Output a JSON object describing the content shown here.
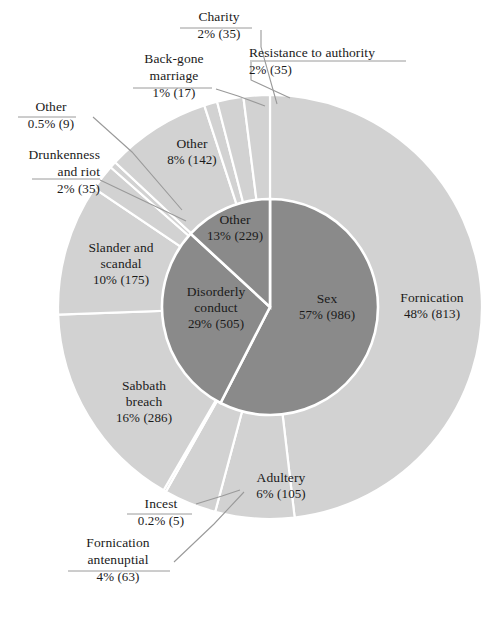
{
  "chart_data": {
    "type": "pie",
    "title": "",
    "subtitle": "",
    "xlabel": "",
    "ylabel": "",
    "legend_position": "none",
    "grid": false,
    "colors": {
      "inner_ring": "#8a8a8a",
      "outer_ring": "#d2d2d2",
      "separator": "#ffffff",
      "leader_line": "#9a9a9a",
      "text": "#1a1a1a",
      "background": "#ffffff"
    },
    "rings": [
      {
        "name": "inner",
        "slices": [
          {
            "label": "Sex",
            "percent": 57,
            "count": 986
          },
          {
            "label": "Disorderly conduct",
            "percent": 29,
            "count": 505
          },
          {
            "label": "Other",
            "percent": 13,
            "count": 229
          }
        ]
      },
      {
        "name": "outer",
        "slices": [
          {
            "label": "Fornication",
            "percent": 48,
            "count": 813,
            "parent": "Sex"
          },
          {
            "label": "Adultery",
            "percent": 6,
            "count": 105,
            "parent": "Sex"
          },
          {
            "label": "Fornication antenuptial",
            "percent": 4,
            "count": 63,
            "parent": "Sex"
          },
          {
            "label": "Incest",
            "percent": 0.2,
            "count": 5,
            "parent": "Sex"
          },
          {
            "label": "Sabbath breach",
            "percent": 16,
            "count": 286,
            "parent": "Disorderly conduct"
          },
          {
            "label": "Slander and scandal",
            "percent": 10,
            "count": 175,
            "parent": "Disorderly conduct"
          },
          {
            "label": "Drunkenness and riot",
            "percent": 2,
            "count": 35,
            "parent": "Disorderly conduct"
          },
          {
            "label": "Other",
            "percent": 0.5,
            "count": 9,
            "parent": "Disorderly conduct"
          },
          {
            "label": "Other",
            "percent": 8,
            "count": 142,
            "parent": "Other"
          },
          {
            "label": "Back-gone marriage",
            "percent": 1,
            "count": 17,
            "parent": "Other"
          },
          {
            "label": "Charity",
            "percent": 2,
            "count": 35,
            "parent": "Other"
          },
          {
            "label": "Resistance to authority",
            "percent": 2,
            "count": 35,
            "parent": "Other"
          }
        ]
      }
    ]
  },
  "labels": {
    "charity": {
      "name": "Charity",
      "value": "2% (35)"
    },
    "backgone": {
      "name": "Back-gone\nmarriage",
      "name_line1": "Back-gone",
      "name_line2": "marriage",
      "value": "1% (17)"
    },
    "resistance": {
      "name": "Resistance to authority",
      "value": "2% (35)"
    },
    "other_half": {
      "name": "Other",
      "value": "0.5% (9)"
    },
    "drunkenness": {
      "name_line1": "Drunkenness",
      "name_line2": "and riot",
      "value": "2% (35)"
    },
    "other_outer": {
      "name": "Other",
      "value": "8% (142)"
    },
    "slander": {
      "name_line1": "Slander and",
      "name_line2": "scandal",
      "value": "10% (175)"
    },
    "sabbath": {
      "name_line1": "Sabbath",
      "name_line2": "breach",
      "value": "16% (286)"
    },
    "incest": {
      "name": "Incest",
      "value": "0.2% (5)"
    },
    "fornication_antenuptial": {
      "name_line1": "Fornication",
      "name_line2": "antenuptial",
      "value": "4% (63)"
    },
    "adultery": {
      "name": "Adultery",
      "value": "6% (105)"
    },
    "fornication": {
      "name": "Fornication",
      "value": "48% (813)"
    },
    "sex": {
      "name": "Sex",
      "value": "57% (986)"
    },
    "disorderly": {
      "name_line1": "Disorderly",
      "name_line2": "conduct",
      "value": "29% (505)"
    },
    "other_inner": {
      "name": "Other",
      "value": "13% (229)"
    }
  }
}
